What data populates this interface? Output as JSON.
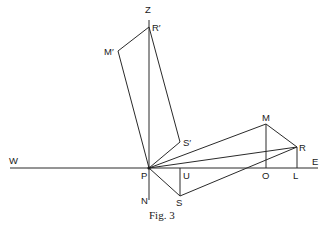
{
  "figure": {
    "caption": "Fig. 3",
    "points": {
      "Z": {
        "label": "Z",
        "x": 149,
        "y": 10
      },
      "R_prime": {
        "label": "R′",
        "x": 149,
        "y": 27
      },
      "M_prime": {
        "label": "M′",
        "x": 118,
        "y": 51
      },
      "S_prime": {
        "label": "S′",
        "x": 180,
        "y": 142
      },
      "P": {
        "label": "P",
        "x": 149,
        "y": 168
      },
      "N": {
        "label": "N",
        "x": 149,
        "y": 200
      },
      "W": {
        "label": "W",
        "x": 10,
        "y": 168
      },
      "E": {
        "label": "E",
        "x": 318,
        "y": 168
      },
      "M": {
        "label": "M",
        "x": 266,
        "y": 124
      },
      "R": {
        "label": "R",
        "x": 297,
        "y": 147
      },
      "L": {
        "label": "L",
        "x": 297,
        "y": 168
      },
      "O": {
        "label": "O",
        "x": 266,
        "y": 168
      },
      "U": {
        "label": "U",
        "x": 180,
        "y": 168
      },
      "S": {
        "label": "S",
        "x": 180,
        "y": 196
      }
    },
    "labels": {
      "Z": "Z",
      "R_prime": "R′",
      "M_prime": "M′",
      "S_prime": "S′",
      "P": "P",
      "N": "N",
      "W": "W",
      "E": "E",
      "M": "M",
      "R": "R",
      "L": "L",
      "O": "O",
      "U": "U",
      "S": "S"
    },
    "segments": [
      [
        "W",
        "E"
      ],
      [
        "Z",
        "N"
      ],
      [
        "R_prime",
        "M_prime"
      ],
      [
        "M_prime",
        "S_prime"
      ],
      [
        "S_prime",
        "R_prime"
      ],
      [
        "P",
        "M"
      ],
      [
        "P",
        "R"
      ],
      [
        "M",
        "R"
      ],
      [
        "M",
        "O"
      ],
      [
        "R",
        "L"
      ],
      [
        "P",
        "S"
      ],
      [
        "S",
        "R"
      ],
      [
        "U",
        "S"
      ]
    ]
  }
}
